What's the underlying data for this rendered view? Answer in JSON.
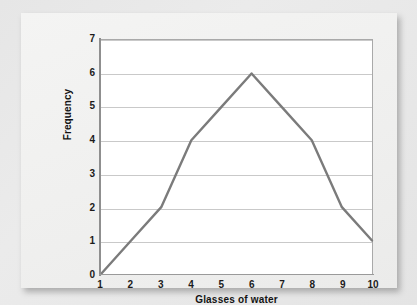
{
  "figure": {
    "background_color": "#e9e9e9",
    "card_color": "#f2f2f1",
    "plot_background": "#ffffff"
  },
  "chart_data": {
    "type": "line",
    "title": "",
    "subtitle": "",
    "xlabel": "Glasses of water",
    "ylabel": "Frequency",
    "x": [
      1,
      2,
      3,
      4,
      5,
      6,
      7,
      8,
      9,
      10
    ],
    "values": [
      0,
      1,
      2,
      4,
      5,
      6,
      5,
      4,
      2,
      1
    ],
    "series": [
      {
        "name": "Frequency",
        "values": [
          0,
          1,
          2,
          4,
          5,
          6,
          5,
          4,
          2,
          1
        ]
      }
    ],
    "xlim": [
      1,
      10
    ],
    "ylim": [
      0,
      7
    ],
    "x_ticks": [
      "1",
      "2",
      "3",
      "4",
      "5",
      "6",
      "7",
      "8",
      "9",
      "10"
    ],
    "y_ticks": [
      "0",
      "1",
      "2",
      "3",
      "4",
      "5",
      "6",
      "7"
    ],
    "grid": "horizontal",
    "legend": "none",
    "line_color": "#7b7b7b",
    "grid_color": "#c9c9c9",
    "axis_color": "#8f8f8f",
    "annotations": []
  }
}
